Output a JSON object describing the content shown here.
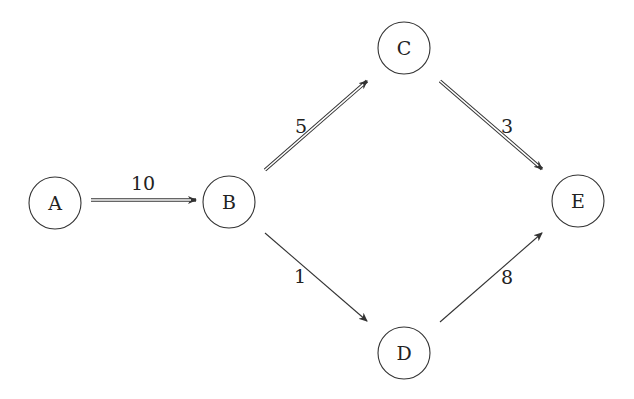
{
  "diagram": {
    "type": "directed-weighted-graph",
    "nodes": [
      {
        "id": "A",
        "label": "A",
        "x": 55,
        "y": 203
      },
      {
        "id": "B",
        "label": "B",
        "x": 229,
        "y": 202
      },
      {
        "id": "C",
        "label": "C",
        "x": 404,
        "y": 48
      },
      {
        "id": "D",
        "label": "D",
        "x": 404,
        "y": 353
      },
      {
        "id": "E",
        "label": "E",
        "x": 578,
        "y": 201
      }
    ],
    "edges": [
      {
        "from": "A",
        "to": "B",
        "weight": "10",
        "style": "double",
        "x1": 91,
        "y1": 200,
        "x2": 196,
        "y2": 200,
        "lx": 143,
        "ly": 183
      },
      {
        "from": "B",
        "to": "C",
        "weight": "5",
        "style": "double",
        "x1": 265,
        "y1": 170,
        "x2": 367,
        "y2": 81,
        "lx": 301,
        "ly": 126
      },
      {
        "from": "C",
        "to": "E",
        "weight": "3",
        "style": "double",
        "x1": 440,
        "y1": 81,
        "x2": 542,
        "y2": 169,
        "lx": 507,
        "ly": 126
      },
      {
        "from": "B",
        "to": "D",
        "weight": "1",
        "style": "single",
        "x1": 265,
        "y1": 233,
        "x2": 367,
        "y2": 321,
        "lx": 300,
        "ly": 276
      },
      {
        "from": "D",
        "to": "E",
        "weight": "8",
        "style": "single",
        "x1": 440,
        "y1": 322,
        "x2": 542,
        "y2": 233,
        "lx": 507,
        "ly": 277
      }
    ],
    "node_radius": 26,
    "stroke_color": "#333333"
  }
}
